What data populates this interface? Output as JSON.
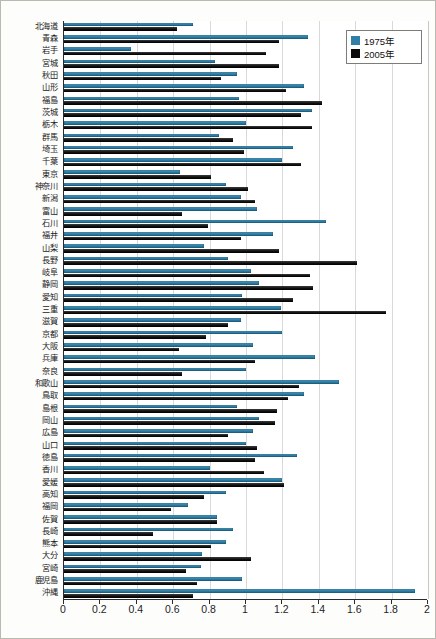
{
  "chart_data": {
    "type": "bar",
    "orientation": "horizontal",
    "title": "",
    "xlabel": "",
    "ylabel": "",
    "xlim": [
      0,
      2
    ],
    "xticks": [
      "0",
      "0.2",
      "0.4",
      "0.6",
      "0.8",
      "1",
      "1.2",
      "1.4",
      "1.6",
      "1.8",
      "2"
    ],
    "grid": true,
    "legend_position": "top-right",
    "colors": {
      "series_1975": "#2f7fa6",
      "series_2005": "#0a0a0a",
      "grid": "#d9d9d9",
      "axis": "#2a2a2a",
      "background": "#ffffff"
    },
    "categories": [
      "北海道",
      "青森",
      "岩手",
      "宮城",
      "秋田",
      "山形",
      "福島",
      "茨城",
      "栃木",
      "群馬",
      "埼玉",
      "千葉",
      "東京",
      "神奈川",
      "新潟",
      "富山",
      "石川",
      "福井",
      "山梨",
      "長野",
      "岐阜",
      "静岡",
      "愛知",
      "三重",
      "滋賀",
      "京都",
      "大阪",
      "兵庫",
      "奈良",
      "和歌山",
      "鳥取",
      "島根",
      "岡山",
      "広島",
      "山口",
      "徳島",
      "香川",
      "愛媛",
      "高知",
      "福岡",
      "佐賀",
      "長崎",
      "熊本",
      "大分",
      "宮崎",
      "鹿児島",
      "沖縄"
    ],
    "series": [
      {
        "name": "1975年",
        "color": "#2f7fa6",
        "values": [
          0.71,
          1.34,
          0.37,
          0.83,
          0.95,
          1.32,
          0.96,
          1.36,
          1.0,
          0.85,
          1.26,
          1.2,
          0.64,
          0.89,
          0.97,
          1.06,
          1.44,
          1.15,
          0.77,
          0.9,
          1.03,
          1.07,
          0.98,
          1.19,
          0.97,
          1.2,
          1.04,
          1.38,
          1.0,
          1.51,
          1.32,
          0.95,
          1.07,
          1.04,
          1.0,
          1.28,
          0.8,
          1.2,
          0.89,
          0.68,
          0.84,
          0.93,
          0.89,
          0.76,
          0.75,
          0.98,
          1.93
        ]
      },
      {
        "name": "2005年",
        "color": "#0a0a0a",
        "values": [
          0.62,
          1.18,
          1.11,
          1.18,
          0.86,
          1.22,
          1.42,
          1.3,
          1.36,
          0.93,
          0.99,
          1.3,
          0.81,
          1.01,
          1.05,
          0.65,
          0.79,
          0.97,
          1.18,
          1.61,
          1.35,
          1.37,
          1.26,
          1.77,
          0.9,
          0.78,
          0.63,
          1.05,
          0.65,
          1.29,
          1.23,
          1.17,
          1.16,
          0.9,
          1.06,
          1.05,
          1.1,
          1.21,
          0.77,
          0.59,
          0.84,
          0.49,
          0.81,
          1.03,
          0.67,
          0.73,
          0.71
        ]
      }
    ]
  },
  "legend": {
    "items": [
      {
        "label": "1975年",
        "color": "#2f7fa6"
      },
      {
        "label": "2005年",
        "color": "#0a0a0a"
      }
    ]
  }
}
